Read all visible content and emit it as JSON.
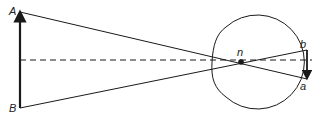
{
  "diagram": {
    "labels": {
      "object_top": "A",
      "object_bottom": "B",
      "nodal_point": "n",
      "image_top": "b",
      "image_bottom": "a"
    },
    "colors": {
      "stroke": "#1a1a1a",
      "background": "#ffffff"
    }
  }
}
